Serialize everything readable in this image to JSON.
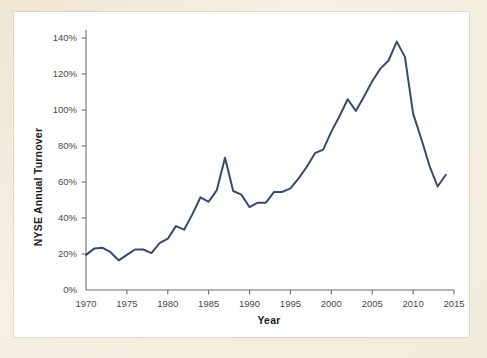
{
  "chart_data": {
    "type": "line",
    "title": "",
    "xlabel": "Year",
    "ylabel": "NYSE Annual Turnover",
    "xlim": [
      1970,
      2015
    ],
    "ylim": [
      0,
      140
    ],
    "grid": false,
    "legend_position": "none",
    "line_color": "#3a4a6b",
    "axis_color": "#6f6f6f",
    "y_tick_labels": [
      "0%",
      "20%",
      "40%",
      "60%",
      "80%",
      "100%",
      "120%",
      "140%"
    ],
    "y_ticks": [
      0,
      20,
      40,
      60,
      80,
      100,
      120,
      140
    ],
    "x_tick_labels": [
      "1970",
      "1975",
      "1980",
      "1985",
      "1990",
      "1995",
      "2000",
      "2005",
      "2010",
      "2015"
    ],
    "x_ticks": [
      1970,
      1975,
      1980,
      1985,
      1990,
      1995,
      2000,
      2005,
      2010,
      2015
    ],
    "x": [
      1970,
      1971,
      1972,
      1973,
      1974,
      1975,
      1976,
      1977,
      1978,
      1979,
      1980,
      1981,
      1982,
      1983,
      1984,
      1985,
      1986,
      1987,
      1988,
      1989,
      1990,
      1991,
      1992,
      1993,
      1994,
      1995,
      1996,
      1997,
      1998,
      1999,
      2000,
      2001,
      2002,
      2003,
      2004,
      2005,
      2006,
      2007,
      2008,
      2009,
      2010,
      2011,
      2012,
      2013,
      2014
    ],
    "values": [
      19.5,
      23,
      23.5,
      21,
      16.5,
      19.5,
      22.5,
      22.5,
      20.5,
      26,
      28.5,
      35.5,
      33.5,
      42,
      51.5,
      49,
      55.5,
      73.5,
      55,
      53,
      46,
      48.5,
      48.5,
      54.5,
      54.5,
      56.5,
      62,
      68.5,
      76,
      78,
      88,
      96.5,
      106,
      99.5,
      107.5,
      116,
      123,
      127.5,
      138,
      129.5,
      98,
      84,
      69,
      57.5,
      64
    ],
    "series": [
      {
        "name": "NYSE Annual Turnover",
        "values": [
          19.5,
          23,
          23.5,
          21,
          16.5,
          19.5,
          22.5,
          22.5,
          20.5,
          26,
          28.5,
          35.5,
          33.5,
          42,
          51.5,
          49,
          55.5,
          73.5,
          55,
          53,
          46,
          48.5,
          48.5,
          54.5,
          54.5,
          56.5,
          62,
          68.5,
          76,
          78,
          88,
          96.5,
          106,
          99.5,
          107.5,
          116,
          123,
          127.5,
          138,
          129.5,
          98,
          84,
          69,
          57.5,
          64
        ]
      }
    ]
  },
  "page": {
    "background_color": "#f2eada",
    "card_color": "#fefefe"
  }
}
